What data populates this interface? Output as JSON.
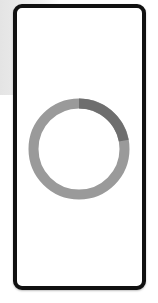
{
  "screen": {
    "type": "loading-screen",
    "frame_color": "#111111",
    "background_color": "#ffffff"
  },
  "spinner": {
    "icon": "loading-spinner-icon",
    "track_color": "#9a9a9a",
    "progress_color": "#6e6e6e",
    "progress_fraction": 0.22
  },
  "caption": {
    "text": ""
  }
}
